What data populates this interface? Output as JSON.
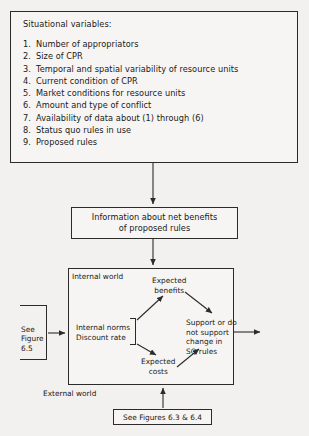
{
  "situational": {
    "title": "Situational variables:",
    "items": [
      {
        "num": "1.",
        "text": "Number of appropriators"
      },
      {
        "num": "2.",
        "text": "Size of CPR"
      },
      {
        "num": "3.",
        "text": "Temporal and spatial variability of resource  units"
      },
      {
        "num": "4.",
        "text": "Current condition of CPR"
      },
      {
        "num": "5.",
        "text": "Market conditions for resource units"
      },
      {
        "num": "6.",
        "text": "Amount and type of conflict"
      },
      {
        "num": "7.",
        "text": "Availability of data about (1) through (6)"
      },
      {
        "num": "8.",
        "text": "Status quo rules in use"
      },
      {
        "num": "9.",
        "text": "Proposed rules"
      }
    ]
  },
  "info_box": {
    "line1": "Information about net benefits",
    "line2": "of proposed rules"
  },
  "internal_world": {
    "label": "Internal world",
    "external_label": "External world",
    "expected_benefits": {
      "line1": "Expected",
      "line2": "benefits"
    },
    "expected_costs": {
      "line1": "Expected",
      "line2": "costs"
    },
    "internal_norms": {
      "line1": "Internal norms",
      "line2": "Discount rate"
    },
    "support": {
      "line1": "Support or do",
      "line2": "not support",
      "line3": "change in",
      "line4": "SQ rules"
    }
  },
  "see_figure_65": {
    "line1": "See",
    "line2": "Figure",
    "line3": "6.5"
  },
  "see_figures_63_64": {
    "text": "See Figures 6.3 & 6.4"
  },
  "colors": {
    "stroke": "#2b2b2b",
    "background": "#f2f1ef",
    "box_fill": "#f6f5f3"
  }
}
